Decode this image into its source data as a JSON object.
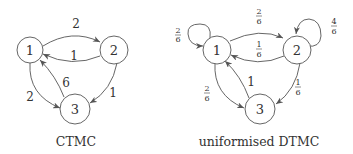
{
  "diagrams": [
    {
      "caption": "CTMC",
      "nodes": [
        {
          "id": "1",
          "label": "1"
        },
        {
          "id": "2",
          "label": "2"
        },
        {
          "id": "3",
          "label": "3"
        }
      ],
      "edges": [
        {
          "from": "1",
          "to": "2",
          "label": "2"
        },
        {
          "from": "2",
          "to": "1",
          "label": "1"
        },
        {
          "from": "2",
          "to": "3",
          "label": "1"
        },
        {
          "from": "3",
          "to": "1",
          "label": "6"
        },
        {
          "from": "1",
          "to": "3",
          "label": "2"
        }
      ]
    },
    {
      "caption": "uniformised DTMC",
      "nodes": [
        {
          "id": "1",
          "label": "1"
        },
        {
          "id": "2",
          "label": "2"
        },
        {
          "id": "3",
          "label": "3"
        }
      ],
      "edges": [
        {
          "from": "1",
          "to": "1",
          "num": "2",
          "den": "6"
        },
        {
          "from": "1",
          "to": "2",
          "num": "2",
          "den": "6"
        },
        {
          "from": "2",
          "to": "1",
          "num": "1",
          "den": "6"
        },
        {
          "from": "2",
          "to": "2",
          "num": "4",
          "den": "6"
        },
        {
          "from": "2",
          "to": "3",
          "num": "1",
          "den": "6"
        },
        {
          "from": "3",
          "to": "1",
          "label": "1"
        },
        {
          "from": "1",
          "to": "3",
          "num": "2",
          "den": "6"
        }
      ]
    }
  ]
}
